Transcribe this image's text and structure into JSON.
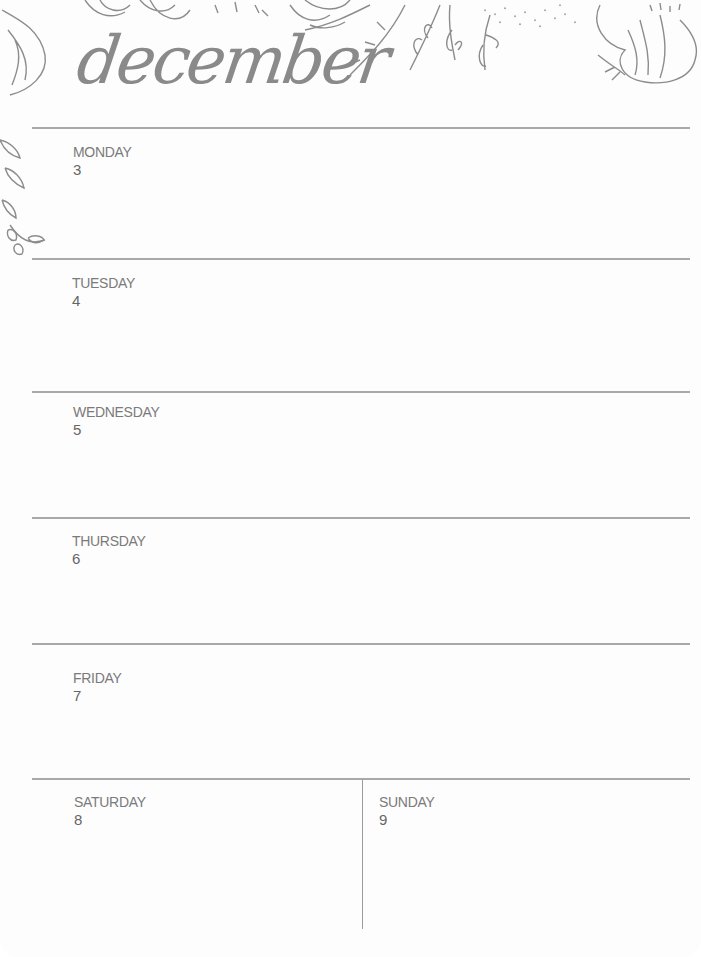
{
  "header": {
    "month_title": "december",
    "decoration": "floral-border-icon"
  },
  "days": [
    {
      "name": "MONDAY",
      "date": "3"
    },
    {
      "name": "TUESDAY",
      "date": "4"
    },
    {
      "name": "WEDNESDAY",
      "date": "5"
    },
    {
      "name": "THURSDAY",
      "date": "6"
    },
    {
      "name": "FRIDAY",
      "date": "7"
    },
    {
      "name": "SATURDAY",
      "date": "8"
    },
    {
      "name": "SUNDAY",
      "date": "9"
    }
  ],
  "colors": {
    "ink": "#7a7a7a",
    "lines": "#a9a9a9",
    "paper": "#fdfdfd"
  }
}
